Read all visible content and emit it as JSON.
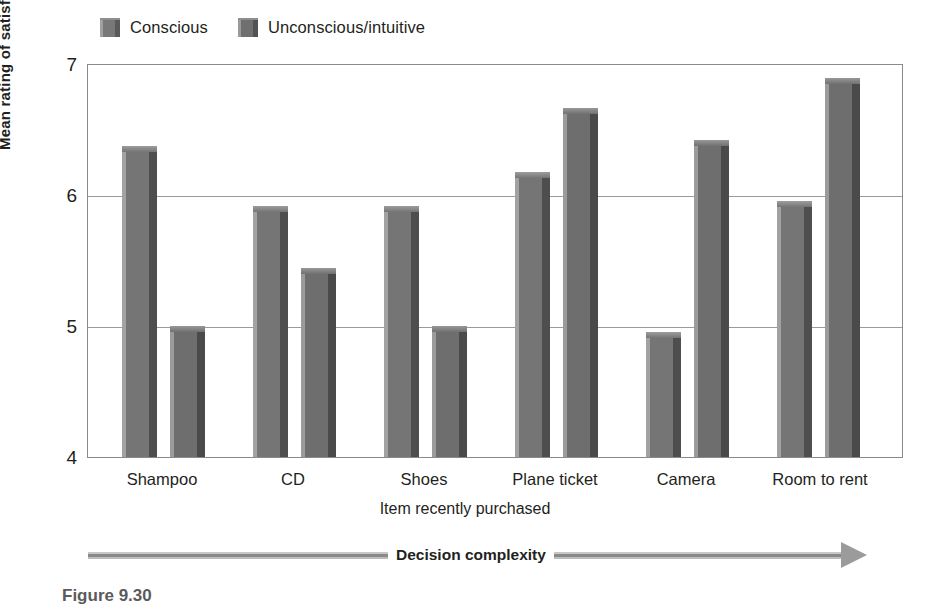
{
  "legend": {
    "position": "top-left",
    "items": [
      {
        "label": "Conscious",
        "color": "#757575",
        "swatch": "legend-swatch-conscious"
      },
      {
        "label": "Unconscious/intuitive",
        "color": "#6e6e6e",
        "swatch": "legend-swatch-unconscious"
      }
    ]
  },
  "axis": {
    "y_title": "Mean rating of satisfaction",
    "x_title": "Item recently purchased",
    "y_ticks": [
      "4",
      "5",
      "6",
      "7"
    ]
  },
  "annotation": {
    "complexity_label": "Decision complexity",
    "caption": "Figure 9.30"
  },
  "chart_data": {
    "type": "bar",
    "title": "",
    "xlabel": "Item recently purchased",
    "ylabel": "Mean rating of satisfaction",
    "ylim": [
      4,
      7
    ],
    "yticks": [
      4,
      5,
      6,
      7
    ],
    "grid": true,
    "legend_position": "top-left",
    "categories": [
      "Shampoo",
      "CD",
      "Shoes",
      "Plane ticket",
      "Camera",
      "Room to rent"
    ],
    "series": [
      {
        "name": "Conscious",
        "color": "#757575",
        "values": [
          6.38,
          5.92,
          5.92,
          6.18,
          4.96,
          5.96
        ]
      },
      {
        "name": "Unconscious/intuitive",
        "color": "#6e6e6e",
        "values": [
          5.0,
          5.45,
          5.0,
          6.67,
          6.43,
          6.9
        ]
      }
    ],
    "annotations": [
      {
        "text": "Decision complexity",
        "type": "arrow",
        "direction": "left-to-right",
        "position": "below-x-axis"
      }
    ]
  }
}
